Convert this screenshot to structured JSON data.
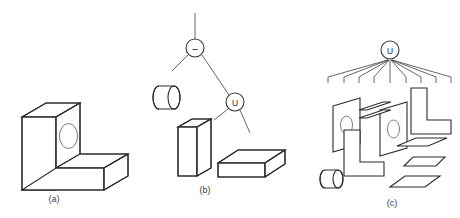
{
  "figure": {
    "background_color": "#ffffff",
    "line_color": "#2b2b2b",
    "thin_line_color": "#4a4a4a",
    "hole_line_color": "#6d6d6d",
    "width": 460,
    "height": 218
  },
  "panels": [
    {
      "id": "a",
      "caption": "(a)",
      "description": "L-shaped bracket solid with circular through hole",
      "shapes": [
        "l-bracket-solid",
        "bracket-hole"
      ]
    },
    {
      "id": "b",
      "caption": "(b)",
      "description": "CSG tree with difference and union operators over primitive solids",
      "shapes": [
        "cylinder-primitive",
        "vertical-box-primitive",
        "horizontal-box-primitive"
      ]
    },
    {
      "id": "c",
      "caption": "(c)",
      "description": "Boundary representation union of component faces",
      "shapes": [
        "l-face-front",
        "l-face-back",
        "hole-face-front",
        "hole-face-back",
        "side-parallelogram-faces",
        "cylinder-primitive"
      ]
    }
  ],
  "csg_tree": {
    "nodes": [
      {
        "id": "root-difference",
        "label": "−",
        "operator": "difference",
        "cx": 195,
        "cy": 48,
        "r": 9
      },
      {
        "id": "union",
        "label": "U",
        "operator": "union",
        "cx": 235,
        "cy": 102,
        "r": 9
      }
    ],
    "root_stem": {
      "x": 195,
      "y_top": 13,
      "y_bottom": 39
    },
    "edges": [
      {
        "from": "root-difference",
        "to": "cylinder-primitive"
      },
      {
        "from": "root-difference",
        "to": "union"
      },
      {
        "from": "union",
        "to": "vertical-box-primitive"
      },
      {
        "from": "union",
        "to": "horizontal-box-primitive"
      }
    ]
  },
  "brep_tree": {
    "node": {
      "id": "union-root",
      "label": "U",
      "operator": "union",
      "cx": 390,
      "cy": 50,
      "r": 9
    },
    "root_stem": {
      "x": 390,
      "y_top": 36,
      "y_bottom": 41
    },
    "fan_leaf_count": 9
  },
  "captions": {
    "a": "(a)",
    "b": "(b)",
    "c": "(c)"
  }
}
